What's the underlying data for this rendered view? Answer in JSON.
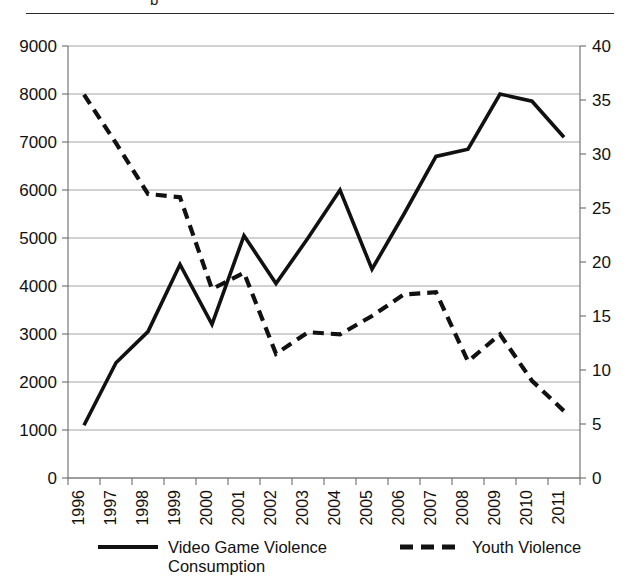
{
  "figure": {
    "title_fragment": "p",
    "has_top_rule": true
  },
  "chart_data": {
    "type": "line",
    "title": "",
    "xlabel": "",
    "ylabel": "",
    "grid": true,
    "legend_position": "bottom",
    "x": [
      1996,
      1997,
      1998,
      1999,
      2000,
      2001,
      2002,
      2003,
      2004,
      2005,
      2006,
      2007,
      2008,
      2009,
      2010,
      2011
    ],
    "xtick_labels": [
      "1996",
      "1997",
      "1998",
      "1999",
      "2000",
      "2001",
      "2002",
      "2003",
      "2004",
      "2005",
      "2006",
      "2007",
      "2008",
      "2009",
      "2010",
      "2011"
    ],
    "left_axis": {
      "ylim": [
        0,
        9000
      ],
      "tick_step": 1000,
      "tick_labels": [
        "0",
        "1000",
        "2000",
        "3000",
        "4000",
        "5000",
        "6000",
        "7000",
        "8000",
        "9000"
      ],
      "tick_values": [
        0,
        1000,
        2000,
        3000,
        4000,
        5000,
        6000,
        7000,
        8000,
        9000
      ]
    },
    "right_axis": {
      "ylim": [
        0,
        40
      ],
      "tick_step": 5,
      "tick_labels": [
        "0",
        "5",
        "10",
        "15",
        "20",
        "25",
        "30",
        "35",
        "40"
      ],
      "tick_values": [
        0,
        5,
        10,
        15,
        20,
        25,
        30,
        35,
        40
      ]
    },
    "series": [
      {
        "name": "Video Game Violence Consumption",
        "axis": "left",
        "style": "solid",
        "color": "#111111",
        "values": [
          1100,
          2400,
          3050,
          4450,
          3200,
          5050,
          4050,
          5000,
          6000,
          4350,
          5500,
          6700,
          6850,
          8000,
          7850,
          7100
        ]
      },
      {
        "name": "Youth Violence",
        "axis": "right",
        "style": "dashed",
        "color": "#111111",
        "values": [
          35.5,
          31.0,
          26.3,
          26.0,
          17.5,
          19.0,
          11.5,
          13.5,
          13.3,
          15.0,
          17.0,
          17.2,
          10.8,
          13.3,
          9.0,
          6.2
        ]
      }
    ],
    "legend": [
      {
        "label_line1": "Video Game Violence",
        "label_line2": "Consumption",
        "style": "solid"
      },
      {
        "label_line1": "Youth Violence",
        "label_line2": "",
        "style": "dashed"
      }
    ]
  }
}
